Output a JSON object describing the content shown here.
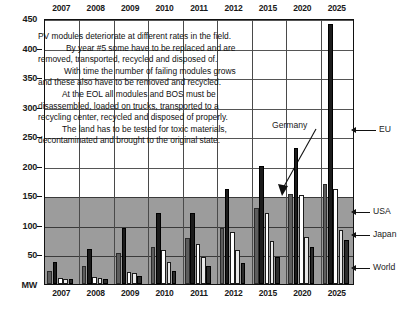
{
  "chart_data": {
    "type": "bar",
    "title": "",
    "xlabel": "",
    "ylabel": "MW",
    "ylim": [
      0,
      450
    ],
    "yticks": [
      0,
      50,
      100,
      150,
      200,
      250,
      300,
      350,
      400,
      450
    ],
    "ytick_labels": [
      "MW",
      "50",
      "100",
      "150",
      "200",
      "250",
      "300",
      "350",
      "400",
      "450"
    ],
    "grid": true,
    "legend_position": "right",
    "categories": [
      "2007",
      "2008",
      "2009",
      "2010",
      "2011",
      "2012",
      "2015",
      "2020",
      "2025"
    ],
    "series": [
      {
        "name": "EU",
        "values": [
          22,
          30,
          52,
          62,
          78,
          95,
          128,
          152,
          170
        ]
      },
      {
        "name": "Germany",
        "values": [
          38,
          60,
          95,
          120,
          120,
          160,
          200,
          230,
          440
        ]
      },
      {
        "name": "USA",
        "values": [
          10,
          12,
          20,
          58,
          68,
          88,
          120,
          150,
          160
        ]
      },
      {
        "name": "Japan",
        "values": [
          9,
          11,
          18,
          38,
          45,
          58,
          72,
          80,
          92
        ]
      },
      {
        "name": "World",
        "values": [
          8,
          9,
          14,
          22,
          30,
          35,
          45,
          62,
          75
        ]
      }
    ],
    "annotations": [
      {
        "text": "Germany",
        "target_category": "2025"
      }
    ],
    "background_band": {
      "from": 0,
      "to": 150,
      "color": "#9c9c9c"
    }
  },
  "axis": {
    "unit_label": "MW",
    "y_labels": [
      "450",
      "400",
      "350",
      "300",
      "250",
      "200",
      "150",
      "100",
      "50",
      "MW"
    ],
    "x_labels_top": [
      "2007",
      "2008",
      "2009",
      "2010",
      "2011",
      "2012",
      "2015",
      "2020",
      "2025"
    ],
    "x_labels_bottom": [
      "2007",
      "2008",
      "2009",
      "2010",
      "2011",
      "2012",
      "2015",
      "2020",
      "2025"
    ]
  },
  "callouts": [
    {
      "label": "EU"
    },
    {
      "label": "USA"
    },
    {
      "label": "Japan"
    },
    {
      "label": "World"
    }
  ],
  "annotation": {
    "germany_label": "Germany"
  },
  "narrative": {
    "lines": [
      "PV modules deteriorate at different rates in the field.",
      "By year #5 some have to be replaced and are",
      "removed, transported, recycled and disposed of.",
      "With time the number of failing modules grows",
      "and these also have to be removed and recycled.",
      "At the EOL all modules and BOS must be",
      "disassembled, loaded on trucks, transported to a",
      "recycling center, recycled and disposed of properly.",
      "The land has to be tested for toxic materials,",
      "decontaminated and brought to the original state."
    ]
  },
  "colors": {
    "eu": "#5d5d5d",
    "germany": "#1b1b1b",
    "usa": "#ffffff",
    "japan": "#e9e9e9",
    "world": "#2b2b2b",
    "band": "#9c9c9c",
    "frame": "#111111"
  }
}
